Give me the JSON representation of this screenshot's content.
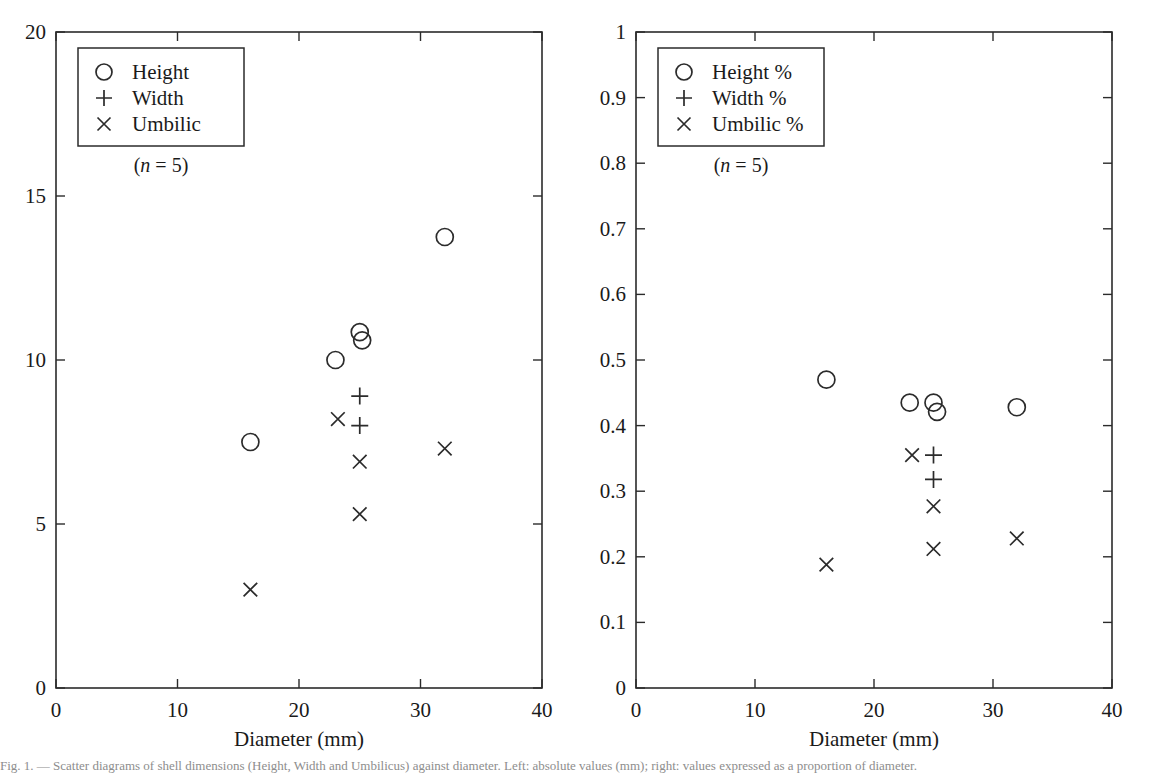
{
  "figure": {
    "background": "#ffffff",
    "ink_color": "#2b2b2b",
    "caption": "Fig. 1. — Scatter diagrams of shell dimensions (Height, Width and Umbilicus) against diameter. Left: absolute values (mm); right: values expressed as a proportion of diameter."
  },
  "chart_data": [
    {
      "type": "scatter",
      "panel": "left",
      "title": "",
      "xlabel": "Diameter (mm)",
      "ylabel": "",
      "xlim": [
        0,
        40
      ],
      "ylim": [
        0,
        20
      ],
      "xticks": [
        0,
        10,
        20,
        30,
        40
      ],
      "xticklabels": [
        "0",
        "10",
        "20",
        "30",
        "40"
      ],
      "yticks": [
        0,
        5,
        10,
        15,
        20
      ],
      "yticklabels": [
        "0",
        "5",
        "10",
        "15",
        "20"
      ],
      "grid": false,
      "legend_position": "upper-left",
      "annotation": "(n = 5)",
      "annotation_italic_part": "n",
      "series": [
        {
          "name": "Height",
          "marker": "circle",
          "points": [
            {
              "x": 16.0,
              "y": 7.5
            },
            {
              "x": 23.0,
              "y": 10.0
            },
            {
              "x": 25.0,
              "y": 10.85
            },
            {
              "x": 25.2,
              "y": 10.6
            },
            {
              "x": 32.0,
              "y": 13.75
            }
          ]
        },
        {
          "name": "Width",
          "marker": "plus",
          "points": [
            {
              "x": 25.0,
              "y": 8.9
            },
            {
              "x": 25.0,
              "y": 8.0
            }
          ]
        },
        {
          "name": "Umbilic",
          "marker": "cross",
          "points": [
            {
              "x": 16.0,
              "y": 3.0
            },
            {
              "x": 23.2,
              "y": 8.2
            },
            {
              "x": 25.0,
              "y": 6.9
            },
            {
              "x": 25.0,
              "y": 5.3
            },
            {
              "x": 32.0,
              "y": 7.3
            }
          ]
        }
      ]
    },
    {
      "type": "scatter",
      "panel": "right",
      "title": "",
      "xlabel": "Diameter (mm)",
      "ylabel": "",
      "xlim": [
        0,
        40
      ],
      "ylim": [
        0,
        1
      ],
      "xticks": [
        0,
        10,
        20,
        30,
        40
      ],
      "xticklabels": [
        "0",
        "10",
        "20",
        "30",
        "40"
      ],
      "yticks": [
        0,
        0.1,
        0.2,
        0.3,
        0.4,
        0.5,
        0.6,
        0.7,
        0.8,
        0.9,
        1
      ],
      "yticklabels": [
        "0",
        "0.1",
        "0.2",
        "0.3",
        "0.4",
        "0.5",
        "0.6",
        "0.7",
        "0.8",
        "0.9",
        "1"
      ],
      "grid": false,
      "legend_position": "upper-left",
      "annotation": "(n = 5)",
      "annotation_italic_part": "n",
      "series": [
        {
          "name": "Height %",
          "marker": "circle",
          "points": [
            {
              "x": 16.0,
              "y": 0.47
            },
            {
              "x": 23.0,
              "y": 0.435
            },
            {
              "x": 25.0,
              "y": 0.435
            },
            {
              "x": 25.3,
              "y": 0.421
            },
            {
              "x": 32.0,
              "y": 0.428
            }
          ]
        },
        {
          "name": "Width %",
          "marker": "plus",
          "points": [
            {
              "x": 25.0,
              "y": 0.355
            },
            {
              "x": 25.0,
              "y": 0.318
            }
          ]
        },
        {
          "name": "Umbilic %",
          "marker": "cross",
          "points": [
            {
              "x": 16.0,
              "y": 0.188
            },
            {
              "x": 23.2,
              "y": 0.355
            },
            {
              "x": 25.0,
              "y": 0.277
            },
            {
              "x": 25.0,
              "y": 0.212
            },
            {
              "x": 32.0,
              "y": 0.228
            }
          ]
        }
      ]
    }
  ]
}
